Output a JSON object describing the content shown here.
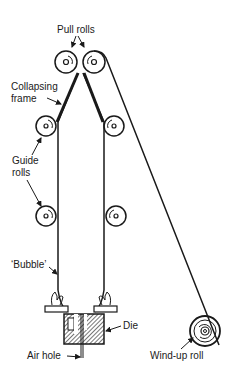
{
  "diagram": {
    "labels": {
      "pull_rolls": "Pull rolls",
      "collapsing_frame_line1": "Collapsing",
      "collapsing_frame_line2": "frame",
      "guide_rolls_line1": "Guide",
      "guide_rolls_line2": "rolls",
      "bubble": "‘Bubble’",
      "die": "Die",
      "air_hole": "Air hole",
      "wind_up_roll": "Wind-up roll"
    },
    "colors": {
      "ink": "#1a1a1a",
      "background": "#ffffff"
    }
  }
}
